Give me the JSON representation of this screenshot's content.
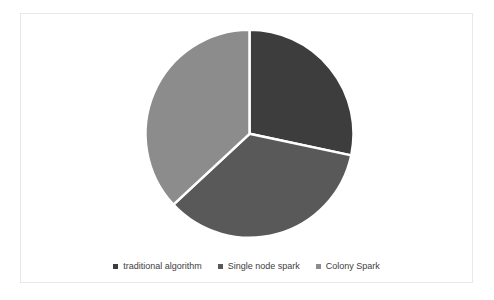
{
  "chart_data": {
    "type": "pie",
    "title": "",
    "labels": [
      "traditional algorithm",
      "Single node spark",
      "Colony Spark"
    ],
    "values": [
      28.3,
      34.7,
      36.9
    ],
    "colors": [
      "#3d3d3d",
      "#595959",
      "#8c8c8c"
    ],
    "start_angle_deg": 0,
    "direction": "clockwise",
    "separator_color": "#ffffff",
    "separator_width": 2.5,
    "legend_position": "bottom",
    "pie_center": {
      "x": 228.5,
      "y": 119.8
    },
    "pie_radius": 104
  },
  "legend": {
    "items": [
      {
        "label": "traditional algorithm",
        "color": "#3d3d3d"
      },
      {
        "label": "Single node spark",
        "color": "#595959"
      },
      {
        "label": "Colony Spark",
        "color": "#8c8c8c"
      }
    ]
  },
  "frame": {
    "border_color": "#e8e8e8",
    "background": "#ffffff"
  }
}
